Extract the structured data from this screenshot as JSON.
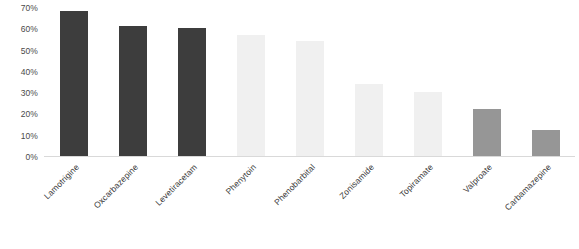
{
  "chart_data": {
    "type": "bar",
    "title": "",
    "subtitle": "",
    "xlabel": "",
    "ylabel": "",
    "categories": [
      "Lamotrigine",
      "Oxcarbazepine",
      "Levetiracetam",
      "Phenytoin",
      "Phenobarbital",
      "Zonisamide",
      "Topiramate",
      "Valproate",
      "Carbamazepine"
    ],
    "values": [
      68,
      61,
      60,
      57,
      54,
      34,
      30,
      22,
      12
    ],
    "bar_colors": [
      "#3d3d3d",
      "#3d3d3d",
      "#3d3d3d",
      "#f0f0f0",
      "#f0f0f0",
      "#f0f0f0",
      "#f0f0f0",
      "#969696",
      "#969696"
    ],
    "ylim": [
      0,
      70
    ],
    "ytick_values": [
      0,
      10,
      20,
      30,
      40,
      50,
      60,
      70
    ],
    "ytick_labels": [
      "0%",
      "10%",
      "20%",
      "30%",
      "40%",
      "50%",
      "60%",
      "70%"
    ],
    "grid": false,
    "legend": null,
    "legend_position": "none",
    "axis_line_color": "#d9d9d9",
    "background_color": "#ffffff",
    "tick_label_color": "#4a4a4a",
    "category_label_rotation": -45
  }
}
